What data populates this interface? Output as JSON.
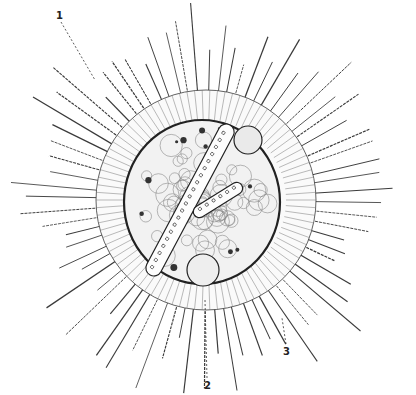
{
  "figure": {
    "center": [
      206,
      200
    ],
    "spine_inner_radius": 95,
    "spine_outer_radius": 185,
    "spine_count": 72,
    "capsule_radius": 100,
    "nucleus_radius": 72,
    "line_color": "#3a3a3a"
  },
  "labels": [
    {
      "id": "1",
      "text": "1",
      "x": 56,
      "y": 10
    },
    {
      "id": "2",
      "text": "2",
      "x": 204,
      "y": 380
    },
    {
      "id": "3",
      "text": "3",
      "x": 283,
      "y": 346
    }
  ],
  "leader_lines": [
    {
      "from": [
        61,
        22
      ],
      "to": [
        95,
        80
      ]
    },
    {
      "from": [
        207,
        378
      ],
      "to": [
        205,
        300
      ]
    },
    {
      "from": [
        286,
        344
      ],
      "to": [
        282,
        318
      ]
    }
  ]
}
